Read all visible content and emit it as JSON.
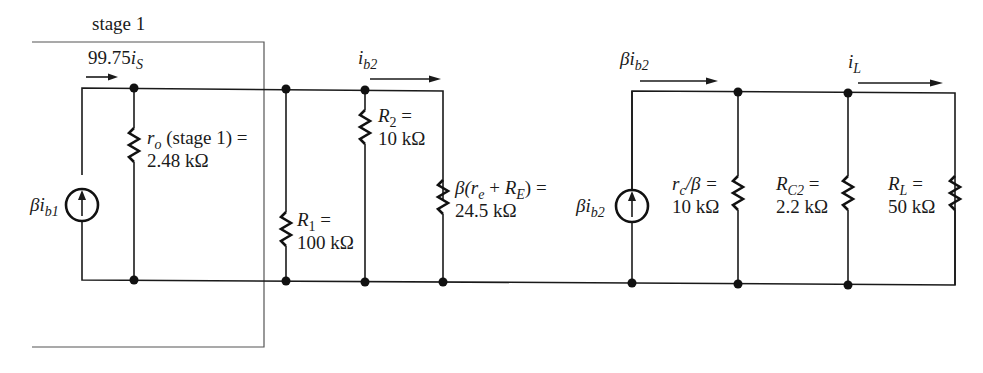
{
  "figure": {
    "stage_box_label": "stage 1",
    "colors": {
      "ink": "#1a1a1a",
      "box": "#555555",
      "background": "#ffffff"
    }
  },
  "currents": {
    "input": {
      "coef": "99.75",
      "sym": "i",
      "sub": "S"
    },
    "ib2": {
      "sym": "i",
      "sub": "b2"
    },
    "beta_ib2_top": {
      "pre": "β",
      "sym": "i",
      "sub": "b2"
    },
    "iL": {
      "sym": "i",
      "sub": "L"
    }
  },
  "sources": {
    "stage1": {
      "pre": "β",
      "sym": "i",
      "sub": "b1",
      "icon": "current-source-up-arrow"
    },
    "stage2": {
      "pre": "β",
      "sym": "i",
      "sub": "b2",
      "icon": "current-source-up-arrow"
    }
  },
  "components": {
    "ro": {
      "sym": "r",
      "sub": "o",
      "rest": " (stage 1) =",
      "value": "2.48 kΩ"
    },
    "R1": {
      "sym": "R",
      "sub": "1",
      "rest": " =",
      "value": "100 kΩ"
    },
    "R2": {
      "sym": "R",
      "sub": "2",
      "rest": " =",
      "value": "10 kΩ"
    },
    "beta_re_RE": {
      "pre": "β(",
      "sym1": "r",
      "sub1": "e",
      "mid": " + ",
      "sym2": "R",
      "sub2": "E",
      "rest": ") =",
      "value": "24.5 kΩ"
    },
    "rc_beta": {
      "sym": "r",
      "sub": "c",
      "rest": "/β =",
      "value": "10 kΩ"
    },
    "RC2": {
      "sym": "R",
      "sub": "C2",
      "rest": " =",
      "value": "2.2 kΩ"
    },
    "RL": {
      "sym": "R",
      "sub": "L",
      "rest": " =",
      "value": "50 kΩ"
    }
  }
}
